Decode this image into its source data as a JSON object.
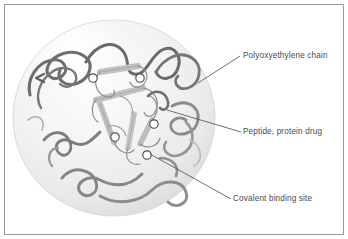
{
  "figure": {
    "background_color": "#ffffff",
    "border_color": "#9a9a9a",
    "sphere": {
      "fill_light": "#fbfbfb",
      "fill_mid": "#ededed",
      "fill_edge": "#d8d8d8",
      "center_x": 114,
      "center_y": 118,
      "radius_x": 101,
      "radius_y": 98
    }
  },
  "labels": [
    {
      "id": "polyoxyethylene-chain",
      "text": "Polyoxyethylene chain",
      "leader_from": [
        198,
        83
      ],
      "leader_to": [
        240,
        56
      ],
      "color": "#4a4a4a"
    },
    {
      "id": "peptide-protein-drug",
      "text": "Peptide, protein drug",
      "leader_from": [
        167,
        110
      ],
      "leader_to": [
        241,
        132
      ],
      "color": "#4a4a4a"
    },
    {
      "id": "covalent-binding-site",
      "text": "Covalent binding site",
      "leader_from": [
        150,
        154
      ],
      "leader_to": [
        231,
        199
      ],
      "color": "#4a4a4a"
    }
  ],
  "binding_sites": [
    {
      "id": "site-1",
      "x": 93,
      "y": 78,
      "r": 4.2
    },
    {
      "id": "site-2",
      "x": 140,
      "y": 78,
      "r": 4.2
    },
    {
      "id": "site-3",
      "x": 154,
      "y": 124,
      "r": 4.2
    },
    {
      "id": "site-4",
      "x": 115,
      "y": 137,
      "r": 4.2
    },
    {
      "id": "site-5",
      "x": 147,
      "y": 155,
      "r": 4.2
    }
  ],
  "elements": {
    "peg_chain_color": "#6e6e6e",
    "peg_chain_color_light": "#9b9b9b",
    "protein_ribbon_color": "#b4b4b4",
    "protein_helix_color": "#c2c2c2",
    "protein_loop_color": "#8f8f8f",
    "binding_site_stroke": "#4f4f4f",
    "binding_site_fill": "#ffffff",
    "leader_line_color": "#555555"
  }
}
